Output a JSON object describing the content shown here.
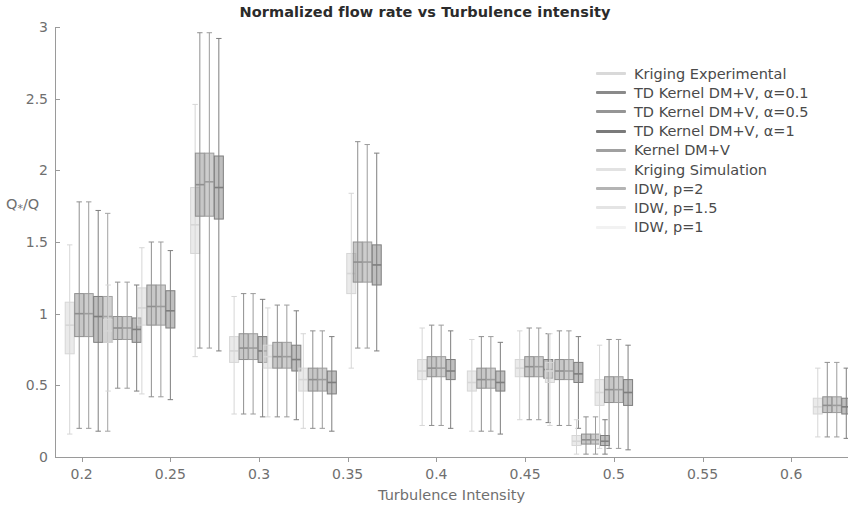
{
  "chart_data": {
    "type": "box",
    "title": "Normalized flow rate vs Turbulence intensity",
    "xlabel": "Turbulence Intensity",
    "ylabel": "Q*/Q",
    "ylabel_base": "Q",
    "ylabel_sub": "*",
    "ylabel_tail": "/Q",
    "xlim": [
      0.185,
      0.632
    ],
    "ylim": [
      0,
      3
    ],
    "xticks": [
      0.2,
      0.25,
      0.3,
      0.35,
      0.4,
      0.45,
      0.5,
      0.55,
      0.6
    ],
    "xtick_labels": [
      "0.2",
      "0.25",
      "0.3",
      "0.35",
      "0.4",
      "0.45",
      "0.5",
      "0.55",
      "0.6"
    ],
    "yticks": [
      0,
      0.5,
      1,
      1.5,
      2,
      2.5,
      3
    ],
    "ytick_labels": [
      "0",
      "0.5",
      "1",
      "1.5",
      "2",
      "2.5",
      "3"
    ],
    "grid": false,
    "legend_position": "upper right",
    "series": [
      {
        "name": "Kriging Experimental",
        "color": "#d6d6d6"
      },
      {
        "name": "TD Kernel DM+V, α=0.1",
        "color": "#8f8f8f"
      },
      {
        "name": "TD Kernel DM+V, α=0.5",
        "color": "#9c9c9c"
      },
      {
        "name": "TD Kernel DM+V, α=1",
        "color": "#7e7e7e"
      },
      {
        "name": "Kernel DM+V",
        "color": "#a3a3a3"
      },
      {
        "name": "Kriging Simulation",
        "color": "#dcdcdc"
      },
      {
        "name": "IDW, p=2",
        "color": "#b6b6b6"
      },
      {
        "name": "IDW, p=1.5",
        "color": "#e0e0e0"
      },
      {
        "name": "IDW, p=1",
        "color": "#efefef"
      }
    ],
    "groups": [
      {
        "x": 0.204,
        "boxes": [
          {
            "series": 0,
            "low": 0.16,
            "q1": 0.72,
            "med": 0.92,
            "q3": 1.08,
            "high": 1.48
          },
          {
            "series": 1,
            "low": 0.2,
            "q1": 0.84,
            "med": 1.0,
            "q3": 1.14,
            "high": 1.78
          },
          {
            "series": 2,
            "low": 0.2,
            "q1": 0.84,
            "med": 1.0,
            "q3": 1.14,
            "high": 1.78
          },
          {
            "series": 3,
            "low": 0.18,
            "q1": 0.8,
            "med": 0.98,
            "q3": 1.12,
            "high": 1.72
          },
          {
            "series": 4,
            "low": 0.18,
            "q1": 0.8,
            "med": 0.98,
            "q3": 1.12,
            "high": 1.7
          }
        ]
      },
      {
        "x": 0.223,
        "boxes": [
          {
            "series": 0,
            "low": 0.46,
            "q1": 0.8,
            "med": 0.88,
            "q3": 0.96,
            "high": 1.2
          },
          {
            "series": 1,
            "low": 0.48,
            "q1": 0.82,
            "med": 0.9,
            "q3": 0.98,
            "high": 1.22
          },
          {
            "series": 2,
            "low": 0.48,
            "q1": 0.82,
            "med": 0.9,
            "q3": 0.98,
            "high": 1.22
          },
          {
            "series": 3,
            "low": 0.46,
            "q1": 0.8,
            "med": 0.89,
            "q3": 0.97,
            "high": 1.2
          }
        ]
      },
      {
        "x": 0.242,
        "boxes": [
          {
            "series": 0,
            "low": 0.44,
            "q1": 0.92,
            "med": 1.04,
            "q3": 1.18,
            "high": 1.46
          },
          {
            "series": 1,
            "low": 0.42,
            "q1": 0.92,
            "med": 1.05,
            "q3": 1.2,
            "high": 1.5
          },
          {
            "series": 2,
            "low": 0.42,
            "q1": 0.92,
            "med": 1.05,
            "q3": 1.2,
            "high": 1.5
          },
          {
            "series": 3,
            "low": 0.4,
            "q1": 0.9,
            "med": 1.02,
            "q3": 1.16,
            "high": 1.44
          }
        ]
      },
      {
        "x": 0.264,
        "boxes": [
          {
            "series": 0,
            "low": 0.7,
            "q1": 1.42,
            "med": 1.62,
            "q3": 1.88,
            "high": 2.46
          }
        ]
      },
      {
        "x": 0.272,
        "boxes": [
          {
            "series": 1,
            "low": 0.76,
            "q1": 1.68,
            "med": 1.9,
            "q3": 2.12,
            "high": 2.96
          },
          {
            "series": 2,
            "low": 0.76,
            "q1": 1.68,
            "med": 1.92,
            "q3": 2.12,
            "high": 2.96
          },
          {
            "series": 3,
            "low": 0.74,
            "q1": 1.66,
            "med": 1.88,
            "q3": 2.1,
            "high": 2.92
          }
        ]
      },
      {
        "x": 0.294,
        "boxes": [
          {
            "series": 0,
            "low": 0.3,
            "q1": 0.66,
            "med": 0.74,
            "q3": 0.84,
            "high": 1.12
          },
          {
            "series": 1,
            "low": 0.3,
            "q1": 0.68,
            "med": 0.76,
            "q3": 0.86,
            "high": 1.14
          },
          {
            "series": 2,
            "low": 0.3,
            "q1": 0.68,
            "med": 0.76,
            "q3": 0.86,
            "high": 1.14
          },
          {
            "series": 3,
            "low": 0.28,
            "q1": 0.66,
            "med": 0.74,
            "q3": 0.84,
            "high": 1.1
          }
        ]
      },
      {
        "x": 0.313,
        "boxes": [
          {
            "series": 0,
            "low": 0.28,
            "q1": 0.62,
            "med": 0.7,
            "q3": 0.78,
            "high": 1.04
          },
          {
            "series": 1,
            "low": 0.28,
            "q1": 0.62,
            "med": 0.7,
            "q3": 0.8,
            "high": 1.06
          },
          {
            "series": 2,
            "low": 0.28,
            "q1": 0.62,
            "med": 0.7,
            "q3": 0.8,
            "high": 1.06
          },
          {
            "series": 3,
            "low": 0.26,
            "q1": 0.6,
            "med": 0.68,
            "q3": 0.78,
            "high": 1.02
          }
        ]
      },
      {
        "x": 0.333,
        "boxes": [
          {
            "series": 0,
            "low": 0.2,
            "q1": 0.46,
            "med": 0.54,
            "q3": 0.62,
            "high": 0.86
          },
          {
            "series": 1,
            "low": 0.2,
            "q1": 0.46,
            "med": 0.54,
            "q3": 0.62,
            "high": 0.88
          },
          {
            "series": 2,
            "low": 0.2,
            "q1": 0.46,
            "med": 0.54,
            "q3": 0.62,
            "high": 0.88
          },
          {
            "series": 3,
            "low": 0.18,
            "q1": 0.44,
            "med": 0.52,
            "q3": 0.6,
            "high": 0.84
          }
        ]
      },
      {
        "x": 0.352,
        "boxes": [
          {
            "series": 0,
            "low": 0.62,
            "q1": 1.14,
            "med": 1.28,
            "q3": 1.42,
            "high": 1.84
          }
        ]
      },
      {
        "x": 0.361,
        "boxes": [
          {
            "series": 1,
            "low": 0.76,
            "q1": 1.22,
            "med": 1.36,
            "q3": 1.5,
            "high": 2.2
          },
          {
            "series": 2,
            "low": 0.76,
            "q1": 1.22,
            "med": 1.36,
            "q3": 1.5,
            "high": 2.18
          },
          {
            "series": 3,
            "low": 0.74,
            "q1": 1.2,
            "med": 1.34,
            "q3": 1.48,
            "high": 2.12
          }
        ]
      },
      {
        "x": 0.4,
        "boxes": [
          {
            "series": 0,
            "low": 0.22,
            "q1": 0.54,
            "med": 0.6,
            "q3": 0.68,
            "high": 0.9
          },
          {
            "series": 1,
            "low": 0.22,
            "q1": 0.56,
            "med": 0.62,
            "q3": 0.7,
            "high": 0.92
          },
          {
            "series": 2,
            "low": 0.22,
            "q1": 0.56,
            "med": 0.62,
            "q3": 0.7,
            "high": 0.92
          },
          {
            "series": 3,
            "low": 0.2,
            "q1": 0.54,
            "med": 0.6,
            "q3": 0.68,
            "high": 0.88
          }
        ]
      },
      {
        "x": 0.428,
        "boxes": [
          {
            "series": 0,
            "low": 0.18,
            "q1": 0.46,
            "med": 0.52,
            "q3": 0.6,
            "high": 0.82
          },
          {
            "series": 1,
            "low": 0.18,
            "q1": 0.48,
            "med": 0.54,
            "q3": 0.62,
            "high": 0.84
          },
          {
            "series": 2,
            "low": 0.18,
            "q1": 0.48,
            "med": 0.54,
            "q3": 0.62,
            "high": 0.84
          },
          {
            "series": 3,
            "low": 0.16,
            "q1": 0.46,
            "med": 0.52,
            "q3": 0.6,
            "high": 0.8
          }
        ]
      },
      {
        "x": 0.455,
        "boxes": [
          {
            "series": 0,
            "low": 0.26,
            "q1": 0.56,
            "med": 0.62,
            "q3": 0.68,
            "high": 0.88
          },
          {
            "series": 1,
            "low": 0.26,
            "q1": 0.56,
            "med": 0.63,
            "q3": 0.7,
            "high": 0.9
          },
          {
            "series": 2,
            "low": 0.26,
            "q1": 0.56,
            "med": 0.63,
            "q3": 0.7,
            "high": 0.9
          },
          {
            "series": 3,
            "low": 0.24,
            "q1": 0.55,
            "med": 0.61,
            "q3": 0.68,
            "high": 0.86
          }
        ]
      },
      {
        "x": 0.472,
        "boxes": [
          {
            "series": 0,
            "low": 0.22,
            "q1": 0.52,
            "med": 0.6,
            "q3": 0.66,
            "high": 0.86
          },
          {
            "series": 1,
            "low": 0.22,
            "q1": 0.54,
            "med": 0.6,
            "q3": 0.68,
            "high": 0.88
          },
          {
            "series": 2,
            "low": 0.22,
            "q1": 0.54,
            "med": 0.6,
            "q3": 0.68,
            "high": 0.88
          },
          {
            "series": 3,
            "low": 0.2,
            "q1": 0.52,
            "med": 0.58,
            "q3": 0.66,
            "high": 0.84
          }
        ]
      },
      {
        "x": 0.487,
        "boxes": [
          {
            "series": 0,
            "low": 0.02,
            "q1": 0.08,
            "med": 0.11,
            "q3": 0.15,
            "high": 0.26
          },
          {
            "series": 1,
            "low": 0.02,
            "q1": 0.09,
            "med": 0.12,
            "q3": 0.16,
            "high": 0.28
          },
          {
            "series": 2,
            "low": 0.02,
            "q1": 0.09,
            "med": 0.12,
            "q3": 0.16,
            "high": 0.28
          },
          {
            "series": 3,
            "low": 0.02,
            "q1": 0.08,
            "med": 0.11,
            "q3": 0.15,
            "high": 0.26
          }
        ]
      },
      {
        "x": 0.5,
        "boxes": [
          {
            "series": 0,
            "low": 0.06,
            "q1": 0.36,
            "med": 0.45,
            "q3": 0.54,
            "high": 0.78
          },
          {
            "series": 1,
            "low": 0.06,
            "q1": 0.38,
            "med": 0.47,
            "q3": 0.56,
            "high": 0.82
          },
          {
            "series": 2,
            "low": 0.06,
            "q1": 0.38,
            "med": 0.47,
            "q3": 0.56,
            "high": 0.82
          },
          {
            "series": 3,
            "low": 0.05,
            "q1": 0.36,
            "med": 0.45,
            "q3": 0.54,
            "high": 0.78
          }
        ]
      },
      {
        "x": 0.623,
        "boxes": [
          {
            "series": 0,
            "low": 0.14,
            "q1": 0.3,
            "med": 0.35,
            "q3": 0.41,
            "high": 0.62
          },
          {
            "series": 1,
            "low": 0.14,
            "q1": 0.31,
            "med": 0.36,
            "q3": 0.42,
            "high": 0.66
          },
          {
            "series": 2,
            "low": 0.14,
            "q1": 0.31,
            "med": 0.36,
            "q3": 0.42,
            "high": 0.66
          },
          {
            "series": 3,
            "low": 0.13,
            "q1": 0.3,
            "med": 0.35,
            "q3": 0.41,
            "high": 0.62
          }
        ]
      }
    ]
  },
  "legend": {
    "items": [
      {
        "label": "Kriging Experimental",
        "color": "#d9d9d9"
      },
      {
        "label": "TD Kernel DM+V, α=0.1",
        "color": "#8a8a8a"
      },
      {
        "label": "TD Kernel DM+V, α=0.5",
        "color": "#959595"
      },
      {
        "label": "TD Kernel DM+V, α=1",
        "color": "#7a7a7a"
      },
      {
        "label": "Kernel DM+V",
        "color": "#a0a0a0"
      },
      {
        "label": "Kriging Simulation",
        "color": "#e2e2e2"
      },
      {
        "label": "IDW, p=2",
        "color": "#b4b4b4"
      },
      {
        "label": "IDW, p=1.5",
        "color": "#e4e4e4"
      },
      {
        "label": "IDW, p=1",
        "color": "#f2f2f2"
      }
    ]
  }
}
